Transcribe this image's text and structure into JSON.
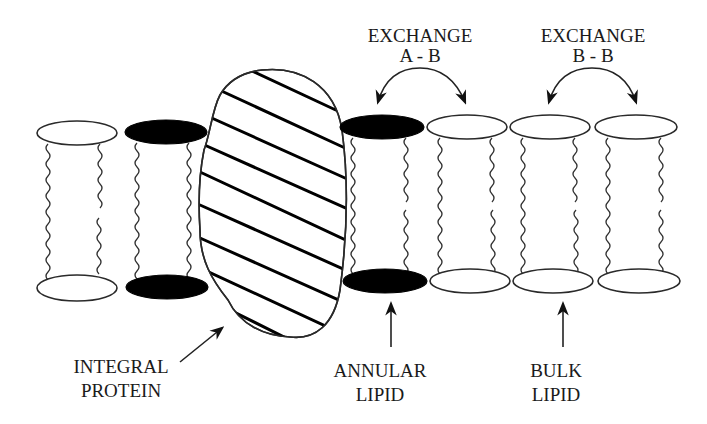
{
  "diagram": {
    "labels": {
      "exchange_ab_line1": "EXCHANGE",
      "exchange_ab_line2": "A - B",
      "exchange_bb_line1": "EXCHANGE",
      "exchange_bb_line2": "B - B",
      "integral_protein_line1": "INTEGRAL",
      "integral_protein_line2": "PROTEIN",
      "annular_lipid_line1": "ANNULAR",
      "annular_lipid_line2": "LIPID",
      "bulk_lipid_line1": "BULK",
      "bulk_lipid_line2": "LIPID"
    },
    "lipids": [
      {
        "id": "bulk-left",
        "type": "bulk",
        "head_color": "white"
      },
      {
        "id": "annular-left",
        "type": "annular",
        "head_color": "black"
      },
      {
        "id": "annular-right",
        "type": "annular",
        "head_color": "black"
      },
      {
        "id": "bulk-1",
        "type": "bulk",
        "head_color": "white"
      },
      {
        "id": "bulk-2",
        "type": "bulk",
        "head_color": "white"
      },
      {
        "id": "bulk-3",
        "type": "bulk",
        "head_color": "white"
      }
    ],
    "colors": {
      "annular_head": "#000000",
      "bulk_head": "#ffffff",
      "line": "#222222",
      "background": "#ffffff"
    }
  }
}
